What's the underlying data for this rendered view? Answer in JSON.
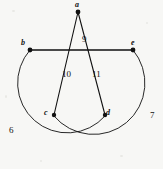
{
  "figure": {
    "background_color": "#f7f7f5",
    "ink_color": "#111111",
    "width": 163,
    "height": 169,
    "vertices": [
      {
        "id": "a",
        "label": "a",
        "x": 78,
        "y": 12,
        "label_x": 75,
        "label_y": 1,
        "dot": true
      },
      {
        "id": "b",
        "label": "b",
        "x": 30,
        "y": 50,
        "label_x": 21,
        "label_y": 39,
        "dot": true
      },
      {
        "id": "e",
        "label": "e",
        "x": 133,
        "y": 50,
        "label_x": 131,
        "label_y": 39,
        "dot": true
      },
      {
        "id": "c",
        "label": "c",
        "x": 54,
        "y": 115,
        "label_x": 44,
        "label_y": 109,
        "dot": true
      },
      {
        "id": "d",
        "label": "d",
        "x": 105,
        "y": 115,
        "label_x": 106,
        "label_y": 109,
        "dot": true
      }
    ],
    "edges": [
      {
        "id": "e9",
        "label": "9",
        "from": "b",
        "to": "e",
        "kind": "segment",
        "label_x": 82,
        "label_y": 35
      },
      {
        "id": "e10",
        "label": "10",
        "from": "a",
        "to": "c",
        "kind": "segment",
        "label_x": 62,
        "label_y": 70
      },
      {
        "id": "e11",
        "label": "11",
        "from": "a",
        "to": "d",
        "kind": "segment",
        "label_x": 92,
        "label_y": 70
      },
      {
        "id": "e6",
        "label": "6",
        "from": "b",
        "to": "d",
        "kind": "arc",
        "label_x": 9,
        "label_y": 126
      },
      {
        "id": "e7",
        "label": "7",
        "from": "e",
        "to": "c",
        "kind": "arc",
        "label_x": 150,
        "label_y": 111
      }
    ],
    "paths": {
      "segment_b_e": "M 30,50 L 133,50",
      "segment_a_c": "M 78,12 L 54,115",
      "segment_a_d": "M 78,12 L 105,115",
      "arc_b_d": "M 30,50 A 48,48 0 1 0 105,116",
      "arc_e_c": "M 133,50 A 48,48 0 1 1 54,116"
    }
  }
}
